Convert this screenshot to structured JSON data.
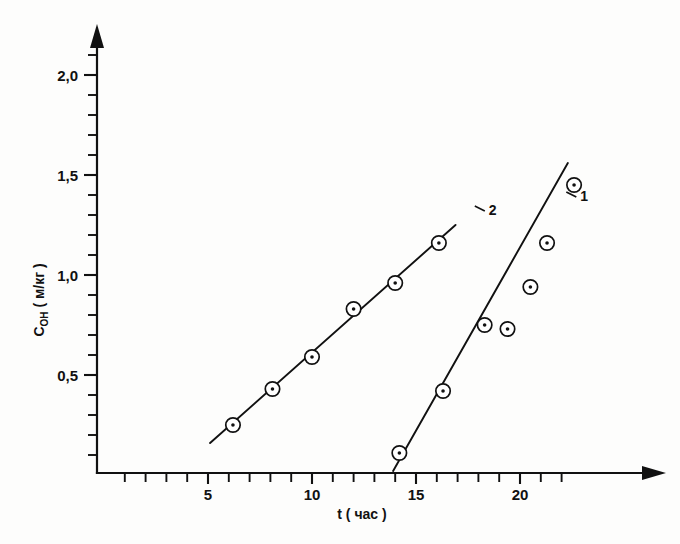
{
  "chart_data": {
    "type": "scatter",
    "title": "",
    "subtitle": "",
    "xlabel": "t ( час )",
    "ylabel": "C",
    "ylabel_sub": "OH",
    "ylabel_units": "( м/кг )",
    "xlim": [
      0,
      27
    ],
    "ylim": [
      0,
      2.2
    ],
    "xticks_major": [
      5,
      10,
      15,
      20
    ],
    "xtick_labels": [
      "5",
      "10",
      "15",
      "20"
    ],
    "xticks_minor": [
      1,
      2,
      3,
      4,
      6,
      7,
      8,
      9,
      11,
      12,
      13,
      14,
      16,
      17,
      18,
      19,
      21,
      22
    ],
    "yticks_major": [
      0.5,
      1.0,
      1.5,
      2.0
    ],
    "ytick_labels": [
      "0,5",
      "1,0",
      "1,5",
      "2,0"
    ],
    "yticks_minor": [
      0.1,
      0.2,
      0.3,
      0.4,
      0.6,
      0.7,
      0.8,
      0.9,
      1.1,
      1.2,
      1.3,
      1.4,
      1.6,
      1.7,
      1.8,
      1.9,
      2.1
    ],
    "grid": false,
    "legend_position": "inline-curve-labels",
    "axis_color": "#111111",
    "series": [
      {
        "name": "1",
        "label": "1",
        "marker": "circle-dot",
        "label_x": 22.9,
        "label_y": 1.37,
        "fit_line": {
          "x": [
            13.9,
            22.3
          ],
          "y": [
            0.02,
            1.56
          ]
        },
        "points": [
          {
            "x": 14.2,
            "y": 0.11
          },
          {
            "x": 16.3,
            "y": 0.42
          },
          {
            "x": 18.3,
            "y": 0.75
          },
          {
            "x": 19.4,
            "y": 0.73
          },
          {
            "x": 20.5,
            "y": 0.94
          },
          {
            "x": 21.3,
            "y": 1.16
          },
          {
            "x": 22.6,
            "y": 1.45
          }
        ]
      },
      {
        "name": "2",
        "label": "2",
        "marker": "circle-dot",
        "label_x": 18.5,
        "label_y": 1.3,
        "fit_line": {
          "x": [
            5.1,
            16.9
          ],
          "y": [
            0.16,
            1.25
          ]
        },
        "points": [
          {
            "x": 6.2,
            "y": 0.25
          },
          {
            "x": 8.1,
            "y": 0.43
          },
          {
            "x": 10.0,
            "y": 0.59
          },
          {
            "x": 12.0,
            "y": 0.83
          },
          {
            "x": 14.0,
            "y": 0.96
          },
          {
            "x": 16.1,
            "y": 1.16
          }
        ]
      }
    ]
  },
  "figure": {
    "caption": ""
  }
}
